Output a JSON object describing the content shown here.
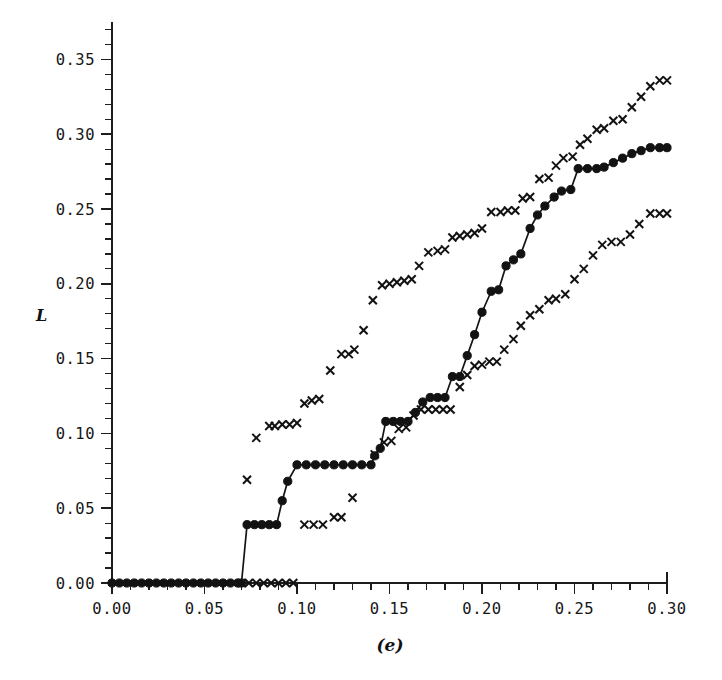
{
  "figure": {
    "panel_label": "(e)",
    "ylabel": "L",
    "xlabel": "",
    "background": "#ffffff",
    "ink_color": "#121212"
  },
  "axes": {
    "x_major_ticks": [
      0.0,
      0.05,
      0.1,
      0.15,
      0.2,
      0.25,
      0.3
    ],
    "x_major_labels": [
      "0.00",
      "0.05",
      "0.10",
      "0.15",
      "0.20",
      "0.25",
      "0.30"
    ],
    "x_minor_step": 0.01,
    "y_major_ticks": [
      0.0,
      0.05,
      0.1,
      0.15,
      0.2,
      0.25,
      0.3,
      0.35
    ],
    "y_major_labels": [
      "0.00",
      "0.05",
      "0.10",
      "0.15",
      "0.20",
      "0.25",
      "0.30",
      "0.35"
    ],
    "y_minor_step": 0.01,
    "xlim": [
      0.0,
      0.3
    ],
    "ylim": [
      0.0,
      0.375
    ],
    "y_axis_top_value": 0.375,
    "grid": false,
    "frame": "left-bottom"
  },
  "chart_data": {
    "type": "line",
    "title": "",
    "xlabel": "(e)",
    "ylabel": "L",
    "xlim": [
      0.0,
      0.3
    ],
    "ylim": [
      0.0,
      0.375
    ],
    "grid": false,
    "legend": "none",
    "series": [
      {
        "name": "upper-confidence-band",
        "marker": "x",
        "line": false,
        "x": [
          0.073,
          0.078,
          0.085,
          0.088,
          0.092,
          0.096,
          0.1,
          0.104,
          0.108,
          0.112,
          0.118,
          0.124,
          0.128,
          0.131,
          0.136,
          0.141,
          0.146,
          0.15,
          0.154,
          0.158,
          0.162,
          0.166,
          0.171,
          0.176,
          0.18,
          0.184,
          0.188,
          0.192,
          0.196,
          0.2,
          0.205,
          0.21,
          0.214,
          0.218,
          0.222,
          0.226,
          0.231,
          0.236,
          0.24,
          0.244,
          0.249,
          0.253,
          0.257,
          0.262,
          0.266,
          0.271,
          0.276,
          0.281,
          0.286,
          0.291,
          0.296,
          0.3
        ],
        "y": [
          0.069,
          0.097,
          0.105,
          0.105,
          0.106,
          0.106,
          0.107,
          0.12,
          0.122,
          0.123,
          0.142,
          0.153,
          0.153,
          0.156,
          0.169,
          0.189,
          0.199,
          0.2,
          0.201,
          0.202,
          0.203,
          0.212,
          0.221,
          0.222,
          0.223,
          0.231,
          0.232,
          0.233,
          0.234,
          0.237,
          0.248,
          0.248,
          0.249,
          0.249,
          0.257,
          0.258,
          0.27,
          0.271,
          0.279,
          0.284,
          0.285,
          0.293,
          0.297,
          0.303,
          0.304,
          0.309,
          0.31,
          0.318,
          0.325,
          0.332,
          0.336,
          0.336
        ]
      },
      {
        "name": "estimate",
        "marker": "o",
        "line": true,
        "x": [
          0.0,
          0.004,
          0.008,
          0.012,
          0.016,
          0.02,
          0.024,
          0.028,
          0.032,
          0.036,
          0.04,
          0.044,
          0.048,
          0.052,
          0.056,
          0.06,
          0.064,
          0.068,
          0.07,
          0.073,
          0.077,
          0.081,
          0.085,
          0.089,
          0.092,
          0.095,
          0.1,
          0.105,
          0.11,
          0.115,
          0.12,
          0.125,
          0.13,
          0.135,
          0.14,
          0.142,
          0.145,
          0.148,
          0.152,
          0.156,
          0.16,
          0.164,
          0.168,
          0.172,
          0.176,
          0.18,
          0.184,
          0.188,
          0.192,
          0.196,
          0.2,
          0.205,
          0.209,
          0.213,
          0.217,
          0.221,
          0.226,
          0.23,
          0.234,
          0.239,
          0.243,
          0.248,
          0.252,
          0.257,
          0.262,
          0.266,
          0.271,
          0.276,
          0.281,
          0.286,
          0.291,
          0.296,
          0.3
        ],
        "y": [
          0.0,
          0.0,
          0.0,
          0.0,
          0.0,
          0.0,
          0.0,
          0.0,
          0.0,
          0.0,
          0.0,
          0.0,
          0.0,
          0.0,
          0.0,
          0.0,
          0.0,
          0.0,
          0.0,
          0.039,
          0.039,
          0.039,
          0.039,
          0.039,
          0.055,
          0.068,
          0.079,
          0.079,
          0.079,
          0.079,
          0.079,
          0.079,
          0.079,
          0.079,
          0.079,
          0.085,
          0.09,
          0.108,
          0.108,
          0.108,
          0.108,
          0.114,
          0.121,
          0.124,
          0.124,
          0.124,
          0.138,
          0.138,
          0.152,
          0.166,
          0.181,
          0.195,
          0.196,
          0.212,
          0.216,
          0.22,
          0.237,
          0.246,
          0.252,
          0.258,
          0.262,
          0.263,
          0.277,
          0.277,
          0.277,
          0.278,
          0.281,
          0.284,
          0.287,
          0.289,
          0.291,
          0.291,
          0.291
        ]
      },
      {
        "name": "lower-confidence-band",
        "marker": "x",
        "line": false,
        "x": [
          0.07,
          0.074,
          0.078,
          0.082,
          0.086,
          0.09,
          0.094,
          0.098,
          0.104,
          0.109,
          0.114,
          0.12,
          0.124,
          0.13,
          0.142,
          0.147,
          0.151,
          0.155,
          0.159,
          0.163,
          0.167,
          0.171,
          0.175,
          0.179,
          0.183,
          0.188,
          0.192,
          0.196,
          0.2,
          0.204,
          0.208,
          0.212,
          0.217,
          0.221,
          0.226,
          0.231,
          0.236,
          0.24,
          0.245,
          0.25,
          0.255,
          0.26,
          0.265,
          0.27,
          0.275,
          0.28,
          0.285,
          0.291,
          0.296,
          0.3
        ],
        "y": [
          0.0,
          0.0,
          0.0,
          0.0,
          0.0,
          0.0,
          0.0,
          0.0,
          0.039,
          0.039,
          0.039,
          0.044,
          0.044,
          0.057,
          0.086,
          0.094,
          0.095,
          0.103,
          0.104,
          0.112,
          0.116,
          0.116,
          0.116,
          0.116,
          0.116,
          0.131,
          0.139,
          0.145,
          0.146,
          0.148,
          0.148,
          0.156,
          0.163,
          0.172,
          0.179,
          0.183,
          0.189,
          0.19,
          0.193,
          0.203,
          0.21,
          0.219,
          0.226,
          0.228,
          0.228,
          0.233,
          0.24,
          0.247,
          0.247,
          0.247
        ]
      }
    ]
  }
}
